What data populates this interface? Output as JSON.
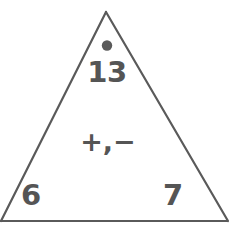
{
  "figure": {
    "kind": "fact-family-triangle",
    "stroke_color": "#5a5a5a",
    "text_color": "#555555",
    "background_color": "#ffffff"
  },
  "triangle": {
    "apex": {
      "dot": "filled-dot-marker",
      "number": "13"
    },
    "center": {
      "operations": "+,−"
    },
    "bottom_left": {
      "number": "6"
    },
    "bottom_right": {
      "number": "7"
    }
  }
}
